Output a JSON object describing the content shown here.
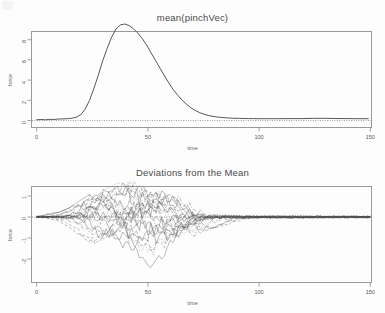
{
  "figure": {
    "background_color": "#fdfdfd",
    "frame_color": "#9a9a9a",
    "ink_color": "#444444"
  },
  "panels": [
    {
      "id": "mean-panel",
      "title": "mean(pinchVec)",
      "xlabel": "time",
      "ylabel": "force",
      "xticks": [
        "0",
        "50",
        "100",
        "150"
      ],
      "yticks": [
        "0",
        "2",
        "4",
        "6",
        "8"
      ]
    },
    {
      "id": "deviations-panel",
      "title": "Deviations from the Mean",
      "xlabel": "time",
      "ylabel": "force",
      "xticks": [
        "0",
        "50",
        "100",
        "150"
      ],
      "yticks": [
        "1",
        "0",
        "-1",
        "-2"
      ]
    }
  ],
  "chart_data": [
    {
      "type": "line",
      "id": "mean-pinch-force",
      "title": "mean(pinchVec)",
      "xlabel": "time",
      "ylabel": "force",
      "xlim": [
        -4,
        155
      ],
      "ylim": [
        -0.55,
        9.3
      ],
      "xticks": [
        0,
        50,
        100,
        150
      ],
      "yticks": [
        0,
        2,
        4,
        6,
        8
      ],
      "grid": false,
      "legend": "none",
      "reference_line": {
        "axis": "y",
        "value": 0,
        "style": "dotted"
      },
      "series": [
        {
          "name": "mean(pinchVec)",
          "style": "solid",
          "x": [
            0,
            2,
            4,
            6,
            8,
            10,
            12,
            14,
            16,
            18,
            20,
            22,
            24,
            26,
            28,
            30,
            32,
            34,
            36,
            38,
            40,
            42,
            44,
            46,
            48,
            50,
            52,
            54,
            56,
            58,
            60,
            62,
            64,
            66,
            68,
            70,
            72,
            74,
            76,
            78,
            80,
            82,
            84,
            86,
            88,
            90,
            92,
            94,
            96,
            98,
            100,
            105,
            110,
            115,
            120,
            125,
            130,
            135,
            140,
            145,
            150
          ],
          "y": [
            0.02,
            0.03,
            0.02,
            0.04,
            0.03,
            0.05,
            0.06,
            0.08,
            0.12,
            0.22,
            0.45,
            0.95,
            1.75,
            2.85,
            4.05,
            5.35,
            6.5,
            7.5,
            8.25,
            8.62,
            8.7,
            8.55,
            8.25,
            7.85,
            7.35,
            6.75,
            6.05,
            5.35,
            4.65,
            3.95,
            3.3,
            2.7,
            2.2,
            1.75,
            1.38,
            1.05,
            0.8,
            0.6,
            0.45,
            0.34,
            0.26,
            0.2,
            0.16,
            0.13,
            0.1,
            0.09,
            0.08,
            0.07,
            0.06,
            0.06,
            0.05,
            0.05,
            0.05,
            0.06,
            0.06,
            0.08,
            0.09,
            0.07,
            0.06,
            0.05,
            0.05
          ]
        }
      ]
    },
    {
      "type": "line",
      "id": "deviations-from-mean",
      "title": "Deviations from the Mean",
      "xlabel": "time",
      "ylabel": "force",
      "xlim": [
        -4,
        155
      ],
      "ylim": [
        -2.75,
        1.85
      ],
      "xticks": [
        0,
        50,
        100,
        150
      ],
      "yticks": [
        -2,
        -1,
        0,
        1
      ],
      "grid": false,
      "legend": "none",
      "reference_line": {
        "axis": "y",
        "value": 0,
        "style": "dotted"
      },
      "n_curves": 20,
      "description": "Twenty noisy replicate deviation curves, mixed solid/dashed/dotted line styles, fanning out between time 15 and 75 then collapsing toward zero.",
      "curve_envelope": {
        "x": [
          0,
          10,
          15,
          20,
          25,
          30,
          35,
          40,
          45,
          50,
          55,
          60,
          65,
          70,
          75,
          80,
          90,
          100,
          120,
          150
        ],
        "upper": [
          0.14,
          0.22,
          0.45,
          0.82,
          1.15,
          1.32,
          1.55,
          1.7,
          1.66,
          1.55,
          1.42,
          1.3,
          1.05,
          0.95,
          0.7,
          0.52,
          0.42,
          0.35,
          0.3,
          0.26
        ],
        "lower": [
          -0.14,
          -0.24,
          -0.5,
          -0.92,
          -1.28,
          -1.45,
          -1.62,
          -1.8,
          -2.05,
          -2.52,
          -2.1,
          -1.72,
          -1.38,
          -1.05,
          -0.68,
          -0.5,
          -0.4,
          -0.34,
          -0.28,
          -0.25
        ]
      },
      "series": [
        {
          "name": "curve-1",
          "style": "solid",
          "peak_time": 30,
          "peak_value": 1.05,
          "trough_time": 55,
          "trough_value": -0.75
        },
        {
          "name": "curve-2",
          "style": "dashed",
          "peak_time": 42,
          "peak_value": 1.6,
          "trough_time": 62,
          "trough_value": -0.55
        },
        {
          "name": "curve-3",
          "style": "dotted",
          "peak_time": 38,
          "peak_value": 1.72,
          "trough_time": 58,
          "trough_value": -0.9
        },
        {
          "name": "curve-4",
          "style": "solid",
          "peak_time": 35,
          "peak_value": 0.82,
          "trough_time": 50,
          "trough_value": -2.5
        },
        {
          "name": "curve-5",
          "style": "dashed",
          "peak_time": 47,
          "peak_value": 1.3,
          "trough_time": 28,
          "trough_value": -1.2
        },
        {
          "name": "curve-6",
          "style": "solid",
          "peak_time": 25,
          "peak_value": 1.12,
          "trough_time": 45,
          "trough_value": -1.05
        },
        {
          "name": "curve-7",
          "style": "dotdash",
          "peak_time": 60,
          "peak_value": 1.08,
          "trough_time": 70,
          "trough_value": -1.35
        },
        {
          "name": "curve-8",
          "style": "solid",
          "peak_time": 52,
          "peak_value": 1.18,
          "trough_time": 33,
          "trough_value": -0.95
        },
        {
          "name": "curve-9",
          "style": "dotted",
          "peak_time": 44,
          "peak_value": 1.45,
          "trough_time": 66,
          "trough_value": -0.8
        },
        {
          "name": "curve-10",
          "style": "dashed",
          "peak_time": 29,
          "peak_value": 0.95,
          "trough_time": 52,
          "trough_value": -1.55
        },
        {
          "name": "curve-11",
          "style": "solid",
          "peak_time": 55,
          "peak_value": 0.88,
          "trough_time": 38,
          "trough_value": -1.15
        },
        {
          "name": "curve-12",
          "style": "solid",
          "peak_time": 40,
          "peak_value": 1.25,
          "trough_time": 60,
          "trough_value": -0.7
        },
        {
          "name": "curve-13",
          "style": "dotted",
          "peak_time": 33,
          "peak_value": 0.7,
          "trough_time": 48,
          "trough_value": -1.75
        },
        {
          "name": "curve-14",
          "style": "dashed",
          "peak_time": 65,
          "peak_value": 1.15,
          "trough_time": 75,
          "trough_value": -0.95
        },
        {
          "name": "curve-15",
          "style": "solid",
          "peak_time": 22,
          "peak_value": 0.65,
          "trough_time": 42,
          "trough_value": -1.45
        },
        {
          "name": "curve-16",
          "style": "dotdash",
          "peak_time": 58,
          "peak_value": 0.92,
          "trough_time": 30,
          "trough_value": -0.85
        },
        {
          "name": "curve-17",
          "style": "solid",
          "peak_time": 36,
          "peak_value": 1.38,
          "trough_time": 56,
          "trough_value": -1.1
        },
        {
          "name": "curve-18",
          "style": "dotted",
          "peak_time": 50,
          "peak_value": 1.02,
          "trough_time": 68,
          "trough_value": -0.65
        },
        {
          "name": "curve-19",
          "style": "dashed",
          "peak_time": 45,
          "peak_value": 0.78,
          "trough_time": 26,
          "trough_value": -1.3
        },
        {
          "name": "curve-20",
          "style": "solid",
          "peak_time": 62,
          "peak_value": 0.74,
          "trough_time": 72,
          "trough_value": -0.88
        }
      ]
    }
  ]
}
